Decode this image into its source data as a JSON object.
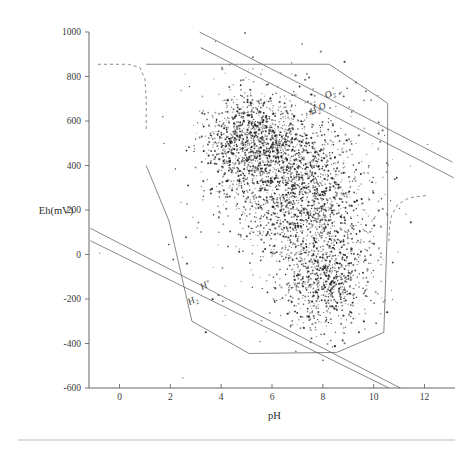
{
  "figure": {
    "name": "eh-ph-diagram",
    "background_color": "#ffffff",
    "line_color": "#6a6a6a",
    "point_color": "#1a1a1a",
    "footer_rule": true
  },
  "chart_data": {
    "type": "scatter",
    "title": "",
    "xlabel": "pH",
    "ylabel": "Eh(mV)",
    "xlim": [
      -1.2,
      13.2
    ],
    "ylim": [
      -600,
      1000
    ],
    "xticks": [
      0,
      2,
      4,
      6,
      8,
      10,
      12
    ],
    "xtick_labels": [
      "0",
      "2",
      "4",
      "6",
      "8",
      "10",
      "12"
    ],
    "yticks": [
      -600,
      -400,
      -200,
      0,
      200,
      400,
      600,
      800,
      1000
    ],
    "ytick_labels": [
      "-600",
      "-400",
      "-200",
      "0",
      "200",
      "400",
      "600",
      "800",
      "1000"
    ],
    "grid": false,
    "legend": "none",
    "annotations": [
      {
        "text": "O2",
        "label": "O₂",
        "base": "O",
        "sub": "2",
        "x": 8.15,
        "y": 700,
        "rotation": -27
      },
      {
        "text": "H2O",
        "label": "H₂O",
        "base": "H",
        "sub": "2",
        "tail": "O",
        "x": 7.55,
        "y": 627,
        "rotation": -27
      },
      {
        "text": "H+",
        "label": "H⁺",
        "base": "H",
        "sup": "+",
        "x": 3.25,
        "y": -160,
        "rotation": -27
      },
      {
        "text": "H2",
        "label": "H₂",
        "base": "H",
        "sub": "2",
        "x": 2.75,
        "y": -228,
        "rotation": -27
      }
    ],
    "boundary_lines": [
      {
        "name": "oxygen-stability-line",
        "style": "solid",
        "points": [
          [
            3.15,
            1000
          ],
          [
            13.1,
            415
          ]
        ]
      },
      {
        "name": "water-oxidation-line",
        "style": "solid",
        "points": [
          [
            3.2,
            930
          ],
          [
            13.15,
            345
          ]
        ]
      },
      {
        "name": "hydrogen-upper-line",
        "style": "solid",
        "points": [
          [
            -1.15,
            118
          ],
          [
            11.05,
            -600
          ]
        ]
      },
      {
        "name": "hydrogen-lower-line",
        "style": "solid",
        "points": [
          [
            -1.15,
            62
          ],
          [
            10.6,
            -600
          ]
        ]
      }
    ],
    "field_outline": {
      "name": "natural-water-field",
      "style": "solid",
      "points": [
        [
          1.05,
          855
        ],
        [
          8.25,
          855
        ],
        [
          10.55,
          680
        ],
        [
          10.55,
          160
        ],
        [
          10.4,
          -350
        ],
        [
          8.55,
          -440
        ],
        [
          5.1,
          -445
        ],
        [
          2.85,
          -300
        ],
        [
          1.95,
          150
        ],
        [
          1.05,
          400
        ]
      ]
    },
    "dashed_arcs": [
      {
        "name": "upper-left-dashed-arc",
        "points": [
          [
            -0.85,
            855
          ],
          [
            0.35,
            855
          ],
          [
            0.8,
            840
          ],
          [
            1.0,
            790
          ],
          [
            1.05,
            700
          ],
          [
            1.05,
            560
          ]
        ]
      },
      {
        "name": "upper-right-dashed-arc",
        "points": [
          [
            12.05,
            265
          ],
          [
            11.4,
            255
          ],
          [
            10.95,
            225
          ],
          [
            10.7,
            175
          ],
          [
            10.62,
            120
          ],
          [
            10.6,
            60
          ]
        ]
      }
    ],
    "scatter": {
      "n_points": 3600,
      "marker": "dot",
      "marker_size": 0.9,
      "description": "Dense boomerang-shaped cloud of natural water samples spanning pH 3-11 and Eh -300 to +750 mV, with an upper-left oxidizing lobe near pH 4-6 / Eh 400-650 and a lower-right descending limb near pH 7-9 / Eh -250 to +300.",
      "clusters": [
        {
          "name": "upper-oxidizing-lobe",
          "cx": 5.1,
          "cy": 520,
          "sx": 0.95,
          "sy": 115,
          "n": 900,
          "rot": -0.55
        },
        {
          "name": "central-core",
          "cx": 6.6,
          "cy": 360,
          "sx": 1.25,
          "sy": 150,
          "n": 1000,
          "rot": -0.35
        },
        {
          "name": "lower-reducing-limb",
          "cx": 7.9,
          "cy": 95,
          "sx": 1.05,
          "sy": 180,
          "n": 900,
          "rot": -0.12
        },
        {
          "name": "deep-reducing-tail",
          "cx": 8.2,
          "cy": -150,
          "sx": 0.85,
          "sy": 95,
          "n": 420,
          "rot": 0.05
        },
        {
          "name": "diffuse-halo",
          "cx": 6.6,
          "cy": 290,
          "sx": 2.2,
          "sy": 280,
          "n": 380,
          "rot": -0.3
        }
      ]
    }
  }
}
